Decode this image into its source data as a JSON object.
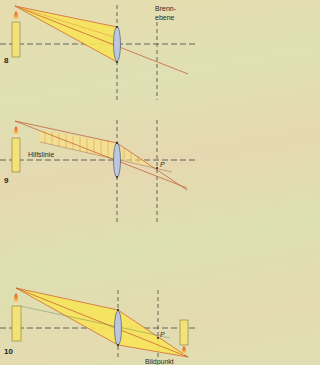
{
  "figures": [
    {
      "number": "8",
      "label": "Brenn-\nebene",
      "label_line1": "Brenn-",
      "label_line2": "ebene"
    },
    {
      "number": "9",
      "label": "Hilfslinie",
      "point": "P"
    },
    {
      "number": "10",
      "point": "P",
      "label": "Bildpunkt"
    }
  ],
  "colors": {
    "background": "#e2dcb0",
    "candle": "#f1e27a",
    "candle_outline": "#8a7a30",
    "ray": "#c8643a",
    "beam_fill": "#f7e35a",
    "lens": "#b9c7e0",
    "axis": "#444444"
  }
}
